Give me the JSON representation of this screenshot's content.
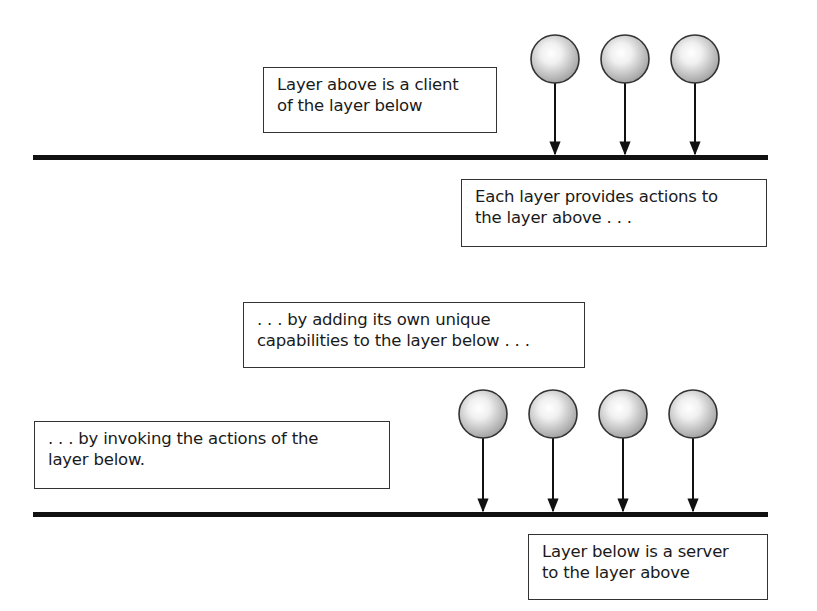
{
  "diagram": {
    "type": "layered-architecture",
    "top_section": {
      "layer_line": {
        "x1": 33,
        "x2": 768,
        "y": 157
      },
      "client_nodes": [
        {
          "cx": 555,
          "cy": 59
        },
        {
          "cx": 625,
          "cy": 59
        },
        {
          "cx": 695,
          "cy": 59
        }
      ],
      "labels": {
        "client_note": {
          "line1": "Layer above is a client",
          "line2": "of the layer below"
        },
        "provides_note": {
          "line1": "Each layer provides actions to",
          "line2": "the layer above . . ."
        }
      }
    },
    "bottom_section": {
      "layer_line": {
        "x1": 33,
        "x2": 768,
        "y": 514
      },
      "client_nodes": [
        {
          "cx": 483,
          "cy": 414
        },
        {
          "cx": 553,
          "cy": 414
        },
        {
          "cx": 623,
          "cy": 414
        },
        {
          "cx": 693,
          "cy": 414
        }
      ],
      "labels": {
        "adding_note": {
          "line1": ". . . by adding its own unique",
          "line2": "capabilities to the layer below . . ."
        },
        "invoking_note": {
          "line1": ". . . by invoking the actions of the",
          "line2": "layer below."
        },
        "server_note": {
          "line1": "Layer below is a server",
          "line2": "to the layer above"
        }
      }
    },
    "colors": {
      "line": "#111111",
      "node_fill_light": "#f7f7f7",
      "node_fill_dark": "#a9a9a9",
      "node_stroke": "#333333",
      "box_border": "#333333"
    }
  }
}
